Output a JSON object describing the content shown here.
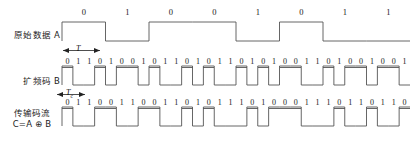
{
  "figure": {
    "caption": "直接序列扩频 (DSSS) 码流时序图",
    "chip_per_bit": 4,
    "line_color": "#555555",
    "text_color": "#1a1a1a"
  },
  "rows": [
    {
      "id": "data-a",
      "label": "原始数据 A",
      "label_lines": [
        "原始数据 A"
      ],
      "bits": [
        "0",
        "1",
        "0",
        "0",
        "1",
        "0",
        "1",
        "1"
      ],
      "period_label": "T",
      "period_label_sub": "",
      "high_is": "0"
    },
    {
      "id": "code-b",
      "label": "扩频码 B",
      "label_lines": [
        "扩频码 B"
      ],
      "bits": [
        "0",
        "1",
        "1",
        "0",
        "1",
        "0",
        "0",
        "1",
        "0",
        "1",
        "1",
        "0",
        "1",
        "0",
        "1",
        "1",
        "0",
        "1",
        "0",
        "1",
        "0",
        "0",
        "1",
        "1",
        "0",
        "1",
        "0",
        "0",
        "1",
        "0",
        "0",
        "1"
      ],
      "period_label": "T",
      "period_label_sub": "c",
      "high_is": "0"
    },
    {
      "id": "stream-c",
      "label": "传输码流 C=A ⊕ B",
      "label_lines": [
        "传输码流",
        "C=A ⊕ B"
      ],
      "bits": [
        "0",
        "1",
        "1",
        "0",
        "0",
        "1",
        "1",
        "0",
        "0",
        "1",
        "1",
        "0",
        "1",
        "0",
        "1",
        "1",
        "1",
        "0",
        "1",
        "0",
        "0",
        "0",
        "1",
        "1",
        "1",
        "0",
        "1",
        "1",
        "0",
        "1",
        "1",
        "0"
      ],
      "period_label": "",
      "period_label_sub": "",
      "high_is": "0"
    }
  ],
  "chart_data": {
    "type": "line",
    "xlabel": "",
    "ylabel": "",
    "series": [
      {
        "name": "原始数据 A",
        "values": [
          0,
          1,
          0,
          0,
          1,
          0,
          1,
          1
        ],
        "samples_per_symbol": 4
      },
      {
        "name": "扩频码 B",
        "values": [
          0,
          1,
          1,
          0,
          1,
          0,
          0,
          1,
          0,
          1,
          1,
          0,
          1,
          0,
          1,
          1,
          0,
          1,
          0,
          1,
          0,
          0,
          1,
          1,
          0,
          1,
          0,
          0,
          1,
          0,
          0,
          1
        ],
        "samples_per_symbol": 1
      },
      {
        "name": "传输码流 C=A ⊕ B",
        "values": [
          0,
          1,
          1,
          0,
          0,
          1,
          1,
          0,
          0,
          1,
          1,
          0,
          1,
          0,
          1,
          1,
          1,
          0,
          1,
          0,
          0,
          0,
          1,
          1,
          1,
          0,
          1,
          1,
          0,
          1,
          1,
          0
        ],
        "samples_per_symbol": 1
      }
    ],
    "annotations": [
      {
        "text": "T",
        "subscript": "",
        "meaning": "bit period of data A"
      },
      {
        "text": "T",
        "subscript": "c",
        "meaning": "chip period of code B"
      }
    ],
    "ylim": [
      0,
      1
    ],
    "grid": false,
    "legend": "left-labels"
  }
}
